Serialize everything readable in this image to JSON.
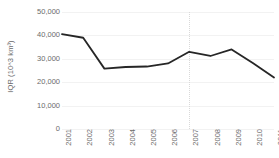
{
  "chart_data": {
    "type": "line",
    "title": "",
    "xlabel": "",
    "ylabel": "IQR (10^3 km³)",
    "categories": [
      "2001",
      "2002",
      "2003",
      "2004",
      "2005",
      "2006",
      "2007",
      "2008",
      "2009",
      "2010",
      "2011"
    ],
    "values": [
      40500,
      39000,
      25800,
      26500,
      26700,
      28000,
      33000,
      31200,
      34000,
      28200,
      22000
    ],
    "series": [
      {
        "name": "IQR",
        "values": [
          40500,
          39000,
          25800,
          26500,
          26700,
          28000,
          33000,
          31200,
          34000,
          28200,
          22000
        ],
        "color": "#262626"
      }
    ],
    "ylim": [
      0,
      50000
    ],
    "ytick_labels": [
      "50,000",
      "40,000",
      "30,000",
      "20,000",
      "10,000",
      "0"
    ],
    "ytick_values": [
      50000,
      40000,
      30000,
      20000,
      10000,
      0
    ],
    "grid": "horizontal",
    "legend": "none",
    "annotations": [
      {
        "name": "vertical-marker-2007",
        "type": "vline",
        "x": "2007",
        "style": "dotted",
        "color": "#d9d9d9"
      }
    ],
    "colors": {
      "line": "#262626",
      "gridline": "#f2f2f2",
      "text": "#6b6b6b",
      "marker_line": "#d9d9d9",
      "background": "#ffffff"
    }
  }
}
